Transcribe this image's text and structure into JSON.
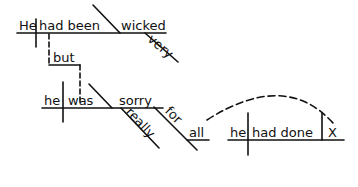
{
  "diagram": {
    "type": "sentence-diagram",
    "colors": {
      "ink": "#111111",
      "background": "#ffffff"
    },
    "clause1": {
      "subject": "He",
      "verb": "had been",
      "predicate_adjective": "wicked",
      "modifier": "very"
    },
    "conjunction": "but",
    "clause2": {
      "subject": "he",
      "verb": "was",
      "predicate_adjective": "sorry",
      "modifier": "really",
      "preposition": "for",
      "object": "all"
    },
    "relative_clause": {
      "subject": "he",
      "verb": "had done",
      "object": "X"
    }
  }
}
